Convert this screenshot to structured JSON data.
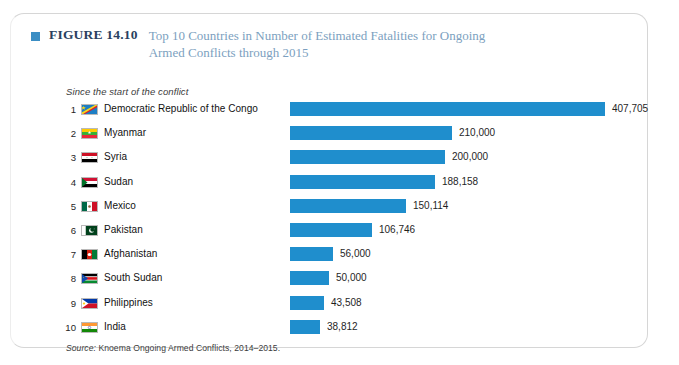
{
  "figure": {
    "marker_icon": "blue-square-icon",
    "label": "FIGURE 14.10",
    "title": "Top 10 Countries in Number of Estimated Fatalities for Ongoing Armed Conflicts through 2015",
    "subtitle": "Since the start of the conflict",
    "source_label": "Source:",
    "source_text": " Knoema Ongoing Armed Conflicts, 2014–2015.",
    "label_color": "#2a3f5f",
    "title_color": "#7c9fc0",
    "marker_color": "#3b8ec4",
    "bar_color": "#1f8ecd",
    "frame_color": "#d6d6d6"
  },
  "chart_data": {
    "type": "bar",
    "orientation": "horizontal",
    "title": "Top 10 Countries in Number of Estimated Fatalities for Ongoing Armed Conflicts through 2015",
    "subtitle": "Since the start of the conflict",
    "source": "Source: Knoema Ongoing Armed Conflicts, 2014–2015.",
    "xlabel": "",
    "ylabel": "",
    "xlim": [
      0,
      407705
    ],
    "grid": false,
    "legend": "none",
    "categories": [
      "Democratic Republic of the Congo",
      "Myanmar",
      "Syria",
      "Sudan",
      "Mexico",
      "Pakistan",
      "Afghanistan",
      "South Sudan",
      "Philippines",
      "India"
    ],
    "values": [
      407705,
      210000,
      200000,
      188158,
      150114,
      106746,
      56000,
      50000,
      43508,
      38812
    ],
    "value_labels": [
      "407,705",
      "210,000",
      "200,000",
      "188,158",
      "150,114",
      "106,746",
      "56,000",
      "50,000",
      "43,508",
      "38,812"
    ],
    "rows": [
      {
        "rank": "1",
        "country": "Democratic Republic of the Congo",
        "value": 407705,
        "value_label": "407,705",
        "flag": "flag-drc"
      },
      {
        "rank": "2",
        "country": "Myanmar",
        "value": 210000,
        "value_label": "210,000",
        "flag": "flag-myanmar"
      },
      {
        "rank": "3",
        "country": "Syria",
        "value": 200000,
        "value_label": "200,000",
        "flag": "flag-syria"
      },
      {
        "rank": "4",
        "country": "Sudan",
        "value": 188158,
        "value_label": "188,158",
        "flag": "flag-sudan"
      },
      {
        "rank": "5",
        "country": "Mexico",
        "value": 150114,
        "value_label": "150,114",
        "flag": "flag-mexico"
      },
      {
        "rank": "6",
        "country": "Pakistan",
        "value": 106746,
        "value_label": "106,746",
        "flag": "flag-pakistan"
      },
      {
        "rank": "7",
        "country": "Afghanistan",
        "value": 56000,
        "value_label": "56,000",
        "flag": "flag-afghanistan"
      },
      {
        "rank": "8",
        "country": "South Sudan",
        "value": 50000,
        "value_label": "50,000",
        "flag": "flag-south-sudan"
      },
      {
        "rank": "9",
        "country": "Philippines",
        "value": 43508,
        "value_label": "43,508",
        "flag": "flag-philippines"
      },
      {
        "rank": "10",
        "country": "India",
        "value": 38812,
        "value_label": "38,812",
        "flag": "flag-india"
      }
    ]
  }
}
